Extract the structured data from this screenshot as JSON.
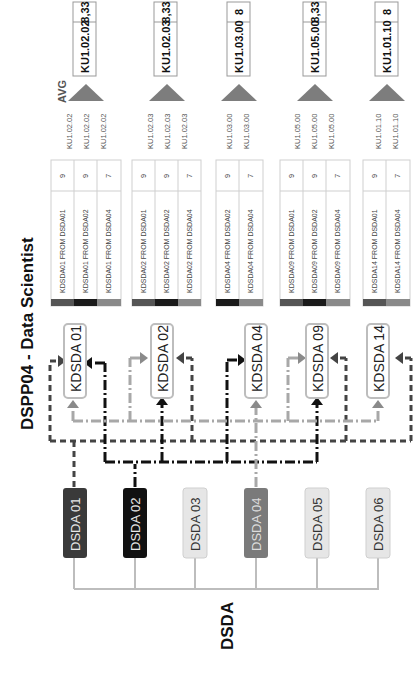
{
  "title": "DSPP04 - Data Scientist",
  "group_label": "DSDA",
  "avg_label": "AVG",
  "colors": {
    "dsda01": "#3a3a3a",
    "dsda02": "#111111",
    "dsda04": "#7a7a7a",
    "dsda_inactive": "#e6e6e6",
    "kdsda_border": "#bdbdbd",
    "triangle": "#7d7d7d",
    "tree_line": "#bdbdbd"
  },
  "sources": [
    {
      "id": "DSDA 01",
      "active": true
    },
    {
      "id": "DSDA 02",
      "active": true
    },
    {
      "id": "DSDA 03",
      "active": false
    },
    {
      "id": "DSDA 04",
      "active": true
    },
    {
      "id": "DSDA 05",
      "active": false
    },
    {
      "id": "DSDA 06",
      "active": false
    }
  ],
  "targets": [
    {
      "id": "KDSDA 01",
      "rows": [
        {
          "label": "KDSDA01 FROM DSDA01",
          "value": "9",
          "ku": "KU1.02.02"
        },
        {
          "label": "KDSDA01 FROM DSDA02",
          "value": "9",
          "ku": "KU1.02.02"
        },
        {
          "label": "KDSDA01 FROM DSDA04",
          "value": "7",
          "ku": "KU1.02.02"
        }
      ],
      "result_ku": "KU1.02.02",
      "result_avg": "8,33"
    },
    {
      "id": "KDSDA 02",
      "rows": [
        {
          "label": "KDSDA02 FROM DSDA01",
          "value": "9",
          "ku": "KU1.02.03"
        },
        {
          "label": "KDSDA02 FROM DSDA02",
          "value": "9",
          "ku": "KU1.02.03"
        },
        {
          "label": "KDSDA02 FROM DSDA04",
          "value": "7",
          "ku": "KU1.02.03"
        }
      ],
      "result_ku": "KU1.02.03",
      "result_avg": "8,33"
    },
    {
      "id": "KDSDA 04",
      "rows": [
        {
          "label": "KDSDA04 FROM DSDA02",
          "value": "9",
          "ku": "KU1.03.00"
        },
        {
          "label": "KDSDA04 FROM DSDA04",
          "value": "7",
          "ku": "KU1.03.00"
        }
      ],
      "result_ku": "KU1.03.00",
      "result_avg": "8"
    },
    {
      "id": "KDSDA 09",
      "rows": [
        {
          "label": "KDSDA09 FROM DSDA01",
          "value": "9",
          "ku": "KU1.05.00"
        },
        {
          "label": "KDSDA09 FROM DSDA02",
          "value": "9",
          "ku": "KU1.05.00"
        },
        {
          "label": "KDSDA09 FROM DSDA04",
          "value": "7",
          "ku": "KU1.05.00"
        }
      ],
      "result_ku": "KU1.05.00",
      "result_avg": "8,33"
    },
    {
      "id": "KDSDA 14",
      "rows": [
        {
          "label": "KDSDA14 FROM DSDA01",
          "value": "9",
          "ku": "KU1.01.10"
        },
        {
          "label": "KDSDA14 FROM DSDA04",
          "value": "7",
          "ku": "KU1.01.10"
        }
      ],
      "result_ku": "KU1.01.10",
      "result_avg": "8"
    }
  ]
}
